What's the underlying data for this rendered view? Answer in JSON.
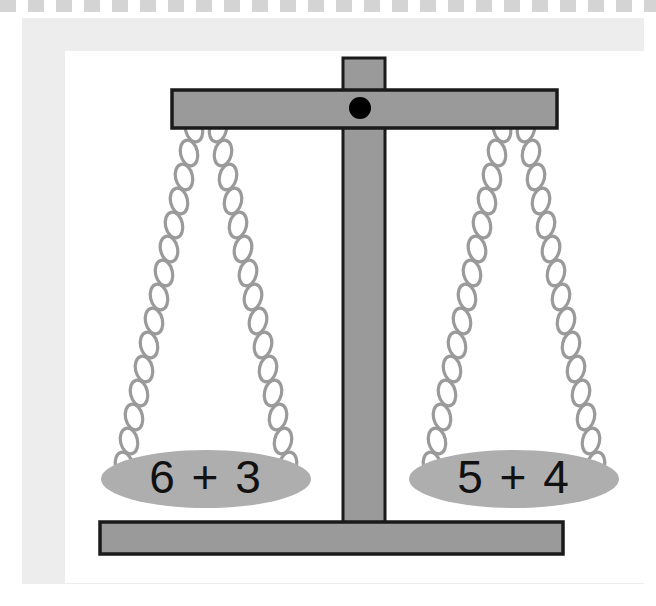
{
  "page": {
    "background_color": "#ffffff"
  },
  "decoration": {
    "top_dashed_strip": {
      "name": "dashed-strip",
      "color": "#d4d4d4",
      "dash_length_px": 16,
      "gap_length_px": 12
    },
    "frame": {
      "name": "photo-frame",
      "color": "#ededed",
      "inner_color": "#ffffff"
    }
  },
  "scale": {
    "name": "balance-scale",
    "state": "balanced",
    "colors": {
      "metal_gray": "#9a9a9a",
      "outline": "#1a1a1a",
      "chain_gray": "#9a9a9a",
      "pan_gray": "#a8a8a8",
      "pivot_black": "#000000"
    },
    "parts": {
      "beam_label": "crossbeam",
      "post_label": "center post",
      "base_label": "base",
      "pivot_label": "pivot point"
    },
    "left_pan": {
      "name": "left-pan",
      "expression": "6 + 3",
      "value": 9,
      "terms": [
        6,
        3
      ],
      "operator": "+"
    },
    "right_pan": {
      "name": "right-pan",
      "expression": "5 + 4",
      "value": 9,
      "terms": [
        5,
        4
      ],
      "operator": "+"
    }
  }
}
